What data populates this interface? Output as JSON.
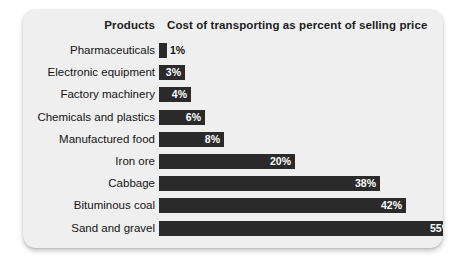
{
  "card": {
    "background": "#efefef",
    "bar_color": "#2a2a2a",
    "label_color": "#141414"
  },
  "header": {
    "products_label": "Products",
    "cost_label": "Cost of transporting as percent of selling price"
  },
  "chart_data": {
    "type": "bar",
    "orientation": "horizontal",
    "title": "Cost of transporting as percent of selling price",
    "xlabel": "Cost of transporting as percent of selling price",
    "ylabel": "Products",
    "xlim": [
      0,
      55
    ],
    "grid": false,
    "legend": null,
    "value_suffix": "%",
    "categories": [
      "Pharmaceuticals",
      "Electronic equipment",
      "Factory machinery",
      "Chemicals and plastics",
      "Manufactured food",
      "Iron ore",
      "Cabbage",
      "Bituminous coal",
      "Sand and gravel"
    ],
    "values": [
      1,
      3,
      4,
      6,
      8,
      20,
      38,
      42,
      55
    ],
    "data_labels": [
      "1%",
      "3%",
      "4%",
      "6%",
      "8%",
      "20%",
      "38%",
      "42%",
      "55%"
    ]
  },
  "rows": [
    {
      "label": "Pharmaceuticals",
      "value": 1,
      "text": "1%",
      "bar_px": 8,
      "label_inside": false
    },
    {
      "label": "Electronic equipment",
      "value": 3,
      "text": "3%",
      "bar_px": 26,
      "label_inside": true
    },
    {
      "label": "Factory machinery",
      "value": 4,
      "text": "4%",
      "bar_px": 32,
      "label_inside": true
    },
    {
      "label": "Chemicals and plastics",
      "value": 6,
      "text": "6%",
      "bar_px": 46,
      "label_inside": true
    },
    {
      "label": "Manufactured food",
      "value": 8,
      "text": "8%",
      "bar_px": 65,
      "label_inside": true
    },
    {
      "label": "Iron ore",
      "value": 20,
      "text": "20%",
      "bar_px": 136,
      "label_inside": true
    },
    {
      "label": "Cabbage",
      "value": 38,
      "text": "38%",
      "bar_px": 221,
      "label_inside": true
    },
    {
      "label": "Bituminous coal",
      "value": 42,
      "text": "42%",
      "bar_px": 247,
      "label_inside": true
    },
    {
      "label": "Sand and gravel",
      "value": 55,
      "text": "55%",
      "bar_px": 296,
      "label_inside": true
    }
  ]
}
